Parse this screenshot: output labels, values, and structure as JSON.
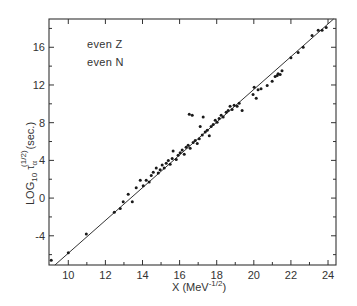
{
  "chart_data": {
    "type": "scatter",
    "title": "",
    "annotations": [
      "even  Z",
      "even  N"
    ],
    "xlabel": "X (MeV^-1/2)",
    "xlabel_main": "X  (MeV",
    "xlabel_sup": "-1/2",
    "xlabel_close": ")",
    "ylabel": "LOG10 τα^(1/2) (sec.)",
    "ylabel_main": "LOG",
    "ylabel_sub": "10",
    "ylabel_tau": "τ",
    "ylabel_alpha": "α",
    "ylabel_sup": "(1/2)",
    "ylabel_unit": "(sec.)",
    "xlim": [
      8.96,
      24.43
    ],
    "ylim": [
      -7.1,
      19.0
    ],
    "x_ticks": [
      10,
      12,
      14,
      16,
      18,
      20,
      22,
      24
    ],
    "y_ticks": [
      -4,
      0,
      4,
      8,
      12,
      16
    ],
    "x_minor_ticks": [
      11,
      13,
      15,
      17,
      19,
      21,
      23
    ],
    "y_minor_ticks": [
      -6,
      -2,
      2,
      6,
      10,
      14,
      18
    ],
    "grid": false,
    "legend": null,
    "fit_line": {
      "x": [
        9.28,
        24.3
      ],
      "y": [
        -7.1,
        19.0
      ],
      "slope": 1.74,
      "intercept": -23.2
    },
    "series": [
      {
        "name": "even Z, even N nuclei",
        "points": [
          [
            9.08,
            -6.6
          ],
          [
            10.0,
            -5.8
          ],
          [
            10.97,
            -3.8
          ],
          [
            12.48,
            -1.5
          ],
          [
            12.8,
            -1.1
          ],
          [
            12.96,
            -0.4
          ],
          [
            13.23,
            0.4
          ],
          [
            13.45,
            -0.4
          ],
          [
            13.66,
            1.1
          ],
          [
            13.88,
            1.9
          ],
          [
            14.04,
            1.3
          ],
          [
            14.2,
            1.9
          ],
          [
            14.36,
            1.7
          ],
          [
            14.47,
            2.4
          ],
          [
            14.58,
            2.75
          ],
          [
            14.74,
            3.2
          ],
          [
            14.85,
            2.65
          ],
          [
            14.95,
            3.0
          ],
          [
            15.06,
            3.5
          ],
          [
            15.17,
            3.2
          ],
          [
            15.28,
            3.7
          ],
          [
            15.39,
            4.0
          ],
          [
            15.49,
            3.6
          ],
          [
            15.6,
            4.2
          ],
          [
            15.65,
            5.0
          ],
          [
            15.82,
            4.1
          ],
          [
            15.92,
            4.55
          ],
          [
            16.03,
            4.8
          ],
          [
            16.14,
            5.1
          ],
          [
            16.25,
            4.65
          ],
          [
            16.35,
            5.4
          ],
          [
            16.46,
            5.6
          ],
          [
            16.52,
            8.9
          ],
          [
            16.68,
            8.8
          ],
          [
            16.57,
            5.3
          ],
          [
            16.73,
            5.9
          ],
          [
            16.84,
            6.1
          ],
          [
            16.95,
            5.8
          ],
          [
            17.06,
            6.3
          ],
          [
            17.11,
            7.6
          ],
          [
            17.22,
            6.7
          ],
          [
            17.27,
            8.6
          ],
          [
            17.38,
            7.0
          ],
          [
            17.49,
            7.2
          ],
          [
            17.6,
            6.6
          ],
          [
            17.7,
            7.6
          ],
          [
            17.81,
            7.8
          ],
          [
            17.92,
            8.25
          ],
          [
            18.02,
            8.05
          ],
          [
            18.13,
            8.45
          ],
          [
            18.24,
            8.8
          ],
          [
            18.35,
            8.6
          ],
          [
            18.51,
            9.1
          ],
          [
            18.62,
            9.3
          ],
          [
            18.72,
            9.75
          ],
          [
            18.83,
            9.4
          ],
          [
            18.94,
            9.85
          ],
          [
            19.1,
            9.75
          ],
          [
            19.21,
            10.05
          ],
          [
            19.37,
            9.3
          ],
          [
            19.96,
            11.0
          ],
          [
            20.02,
            11.75
          ],
          [
            20.13,
            10.6
          ],
          [
            20.23,
            11.5
          ],
          [
            20.39,
            11.6
          ],
          [
            20.72,
            11.95
          ],
          [
            20.99,
            12.4
          ],
          [
            21.15,
            12.9
          ],
          [
            21.26,
            13.0
          ],
          [
            21.31,
            13.2
          ],
          [
            21.42,
            13.1
          ],
          [
            21.52,
            13.5
          ],
          [
            22.0,
            14.9
          ],
          [
            22.39,
            15.45
          ],
          [
            22.66,
            16.0
          ],
          [
            23.14,
            17.25
          ],
          [
            23.47,
            17.8
          ],
          [
            23.68,
            17.8
          ],
          [
            23.9,
            18.1
          ]
        ]
      }
    ]
  },
  "colors": {
    "ink": "#1a1a1a",
    "axis": "#333333",
    "background": "#ffffff"
  },
  "layout_px": {
    "left": 49,
    "right": 336,
    "top": 19,
    "bottom": 265
  }
}
